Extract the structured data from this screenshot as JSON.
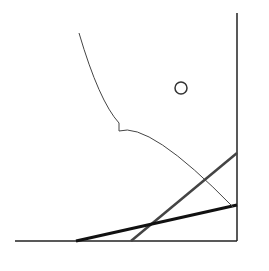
{
  "axes": {
    "x_label": "X",
    "y_label": "Y"
  },
  "lines": [
    {
      "name": "A",
      "start_label": "A",
      "end_label": "A",
      "weight": "medium"
    },
    {
      "name": "B",
      "start_label": "B",
      "end_label": "B",
      "weight": "bold"
    }
  ],
  "point": {
    "label": "Q",
    "subscript": "0"
  },
  "annotation": "비효율적생산구간"
}
